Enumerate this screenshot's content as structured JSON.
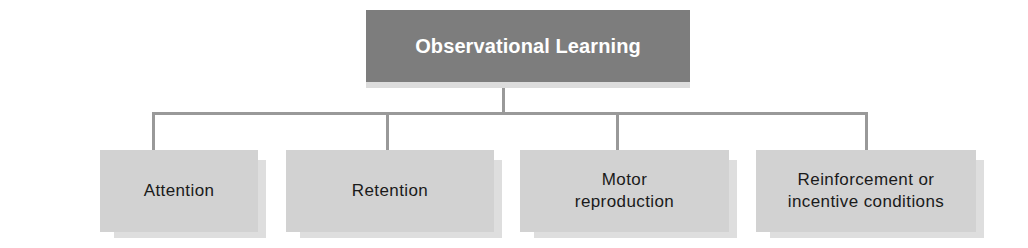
{
  "diagram": {
    "type": "hierarchy",
    "root": {
      "label": "Observational Learning",
      "fill": "#7d7d7d",
      "text_color": "#ffffff"
    },
    "children": [
      {
        "label": "Attention"
      },
      {
        "label": "Retention"
      },
      {
        "label": "Motor\nreproduction"
      },
      {
        "label": "Reinforcement or\nincentive conditions"
      }
    ],
    "child_fill": "#d2d2d2",
    "connector_color": "#999999"
  }
}
